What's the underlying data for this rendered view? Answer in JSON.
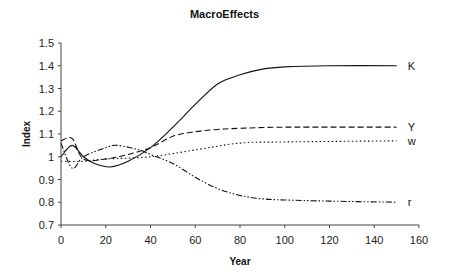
{
  "chart_data": {
    "type": "line",
    "title": "MacroEffects",
    "xlabel": "Year",
    "ylabel": "Index",
    "xlim": [
      0,
      160
    ],
    "ylim": [
      0.7,
      1.5
    ],
    "xticks": [
      0,
      20,
      40,
      60,
      80,
      100,
      120,
      140,
      160
    ],
    "yticks": [
      0.7,
      0.8,
      0.9,
      1,
      1.1,
      1.2,
      1.3,
      1.4,
      1.5
    ],
    "ytick_labels": [
      "0.7",
      "0.8",
      "0.9",
      "1",
      "1.1",
      "1.2",
      "1.3",
      "1.4",
      "1.5"
    ],
    "grid": false,
    "legend": "inline labels at line ends",
    "series": [
      {
        "name": "K",
        "style": "solid",
        "x": [
          0,
          5,
          10,
          15,
          22,
          30,
          40,
          50,
          60,
          70,
          80,
          90,
          100,
          120,
          150
        ],
        "values": [
          1.0,
          1.05,
          1.0,
          0.97,
          0.955,
          0.98,
          1.04,
          1.13,
          1.23,
          1.32,
          1.36,
          1.385,
          1.395,
          1.4,
          1.4
        ]
      },
      {
        "name": "Y",
        "style": "dashed",
        "x": [
          0,
          5,
          10,
          20,
          30,
          40,
          50,
          60,
          70,
          80,
          100,
          150
        ],
        "values": [
          1.07,
          1.08,
          0.99,
          0.99,
          1.01,
          1.04,
          1.09,
          1.11,
          1.12,
          1.125,
          1.13,
          1.13
        ]
      },
      {
        "name": "w",
        "style": "dotted",
        "x": [
          0,
          10,
          20,
          40,
          60,
          80,
          100,
          150
        ],
        "values": [
          0.98,
          0.98,
          0.99,
          1.0,
          1.03,
          1.06,
          1.065,
          1.07
        ]
      },
      {
        "name": "r",
        "style": "dash-dot-dot",
        "x": [
          0,
          5,
          10,
          20,
          25,
          35,
          40,
          50,
          60,
          70,
          80,
          90,
          100,
          120,
          150
        ],
        "values": [
          1.06,
          0.95,
          1.0,
          1.04,
          1.05,
          1.03,
          1.01,
          0.97,
          0.91,
          0.86,
          0.83,
          0.815,
          0.81,
          0.805,
          0.8
        ]
      }
    ]
  }
}
